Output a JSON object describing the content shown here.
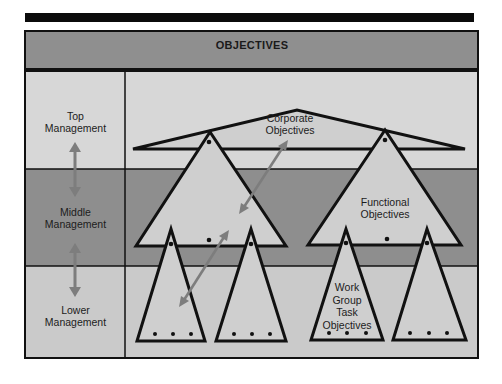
{
  "header": {
    "title": "OBJECTIVES"
  },
  "levels": [
    {
      "label_line1": "Top",
      "label_line2": "Management"
    },
    {
      "label_line1": "Middle",
      "label_line2": "Management"
    },
    {
      "label_line1": "Lower",
      "label_line2": "Management"
    }
  ],
  "diagram": {
    "corporate": {
      "line1": "Corporate",
      "line2": "Objectives"
    },
    "functional": {
      "line1": "Functional",
      "line2": "Objectives"
    },
    "work_group": {
      "line1": "Work",
      "line2": "Group",
      "line3": "Task",
      "line4": "Objectives"
    }
  },
  "colors": {
    "header_band": "#8f8f8f",
    "top_band": "#d6d6d6",
    "middle_band": "#8e8e8e",
    "lower_band": "#c9c9c9",
    "triangle_fill": "#cfcfcf",
    "arrow": "#7d7d7d",
    "outline": "#111111"
  }
}
